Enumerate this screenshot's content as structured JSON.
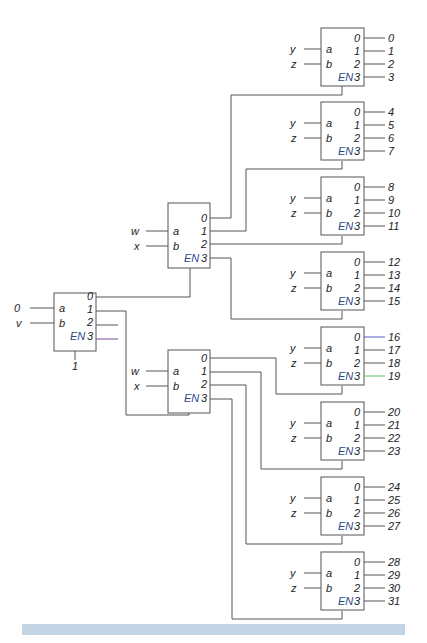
{
  "diagram": {
    "title": "",
    "colors": {
      "wire": "#555555",
      "en_label": "#2a4a8a",
      "bottom_bar": "#c4d4e4"
    },
    "root_decoder": {
      "inputs": {
        "a": "0",
        "b": "v"
      },
      "enable": "1",
      "pin_labels": {
        "a": "a",
        "b": "b",
        "en": "EN",
        "outs": [
          "0",
          "1",
          "2",
          "3"
        ]
      }
    },
    "mid_decoders": [
      {
        "inputs": {
          "a": "w",
          "b": "x"
        },
        "pin_labels": {
          "a": "a",
          "b": "b",
          "en": "EN",
          "outs": [
            "0",
            "1",
            "2",
            "3"
          ]
        }
      },
      {
        "inputs": {
          "a": "w",
          "b": "x"
        },
        "pin_labels": {
          "a": "a",
          "b": "b",
          "en": "EN",
          "outs": [
            "0",
            "1",
            "2",
            "3"
          ]
        }
      }
    ],
    "leaf_decoders": [
      {
        "inputs": {
          "a": "y",
          "b": "z"
        },
        "outputs": [
          "0",
          "1",
          "2",
          "3"
        ]
      },
      {
        "inputs": {
          "a": "y",
          "b": "z"
        },
        "outputs": [
          "4",
          "5",
          "6",
          "7"
        ]
      },
      {
        "inputs": {
          "a": "y",
          "b": "z"
        },
        "outputs": [
          "8",
          "9",
          "10",
          "11"
        ]
      },
      {
        "inputs": {
          "a": "y",
          "b": "z"
        },
        "outputs": [
          "12",
          "13",
          "14",
          "15"
        ]
      },
      {
        "inputs": {
          "a": "y",
          "b": "z"
        },
        "outputs": [
          "16",
          "17",
          "18",
          "19"
        ]
      },
      {
        "inputs": {
          "a": "y",
          "b": "z"
        },
        "outputs": [
          "20",
          "21",
          "22",
          "23"
        ]
      },
      {
        "inputs": {
          "a": "y",
          "b": "z"
        },
        "outputs": [
          "24",
          "25",
          "26",
          "27"
        ]
      },
      {
        "inputs": {
          "a": "y",
          "b": "z"
        },
        "outputs": [
          "28",
          "29",
          "30",
          "31"
        ]
      }
    ]
  }
}
